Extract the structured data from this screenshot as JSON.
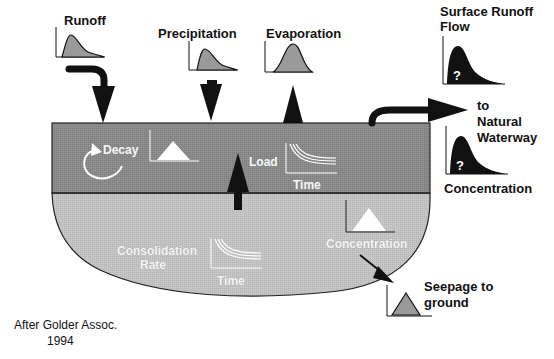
{
  "diagram": {
    "title_labels": {
      "runoff": "Runoff",
      "precipitation": "Precipitation",
      "evaporation": "Evaporation",
      "surface_runoff_flow_line1": "Surface Runoff",
      "surface_runoff_flow_line2": "Flow",
      "to_natural_waterway_line1": "to",
      "to_natural_waterway_line2": "Natural",
      "to_natural_waterway_line3": "Waterway",
      "concentration_right": "Concentration",
      "seepage_line1": "Seepage to",
      "seepage_line2": "ground"
    },
    "pond_labels": {
      "decay": "Decay",
      "load": "Load",
      "time_upper": "Time",
      "consolidation_line1": "Consolidation",
      "consolidation_line2": "Rate",
      "time_lower": "Time",
      "concentration_lower": "Concentration"
    },
    "unknown_marker": "?",
    "credit_line1": "After Golder Assoc.",
    "credit_line2": "1994",
    "colors": {
      "upper_layer": "#8c8c8c",
      "lower_layer": "#c4c4c4",
      "curve_fill": "#9a9a9a",
      "dark": "#111111",
      "white": "#ffffff"
    }
  }
}
